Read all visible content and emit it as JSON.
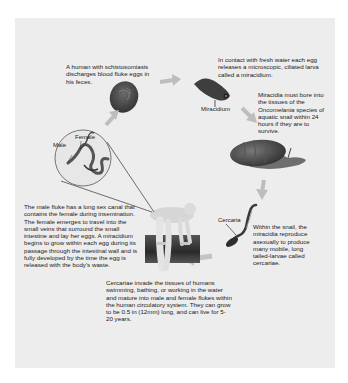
{
  "diagram": {
    "colors": {
      "background": "#ffffff",
      "panel": "#ededed",
      "arrow": "#b8b8b8",
      "egg": "#4a4a4a",
      "text": "#1a1a1a"
    },
    "steps": {
      "human_eggs": "A human with schistosomiasis discharges blood fluke eggs in his feces.",
      "miracidium_release": "In contact with fresh water each egg releases a microscopic, ciliated larva called a miracidium.",
      "snail_entry_pre": "Miracidia must bore into the tissues of the ",
      "snail_entry_species": "Oncomelania",
      "snail_entry_post": " species of aquatic snail within 24 hours if they are to survive.",
      "snail_reproduction": "Within the snail, the miracidia reproduce asexually to produce many mobile, long tailed-larvae called cercariae.",
      "cercariae_invade": "Cercariae invade the tissues of humans swimming, bathing, or working in the water and mature into male and female flukes within the human circulatory system. They can grow to be 0.5 in (12mm) long, and can live for 5-20 years.",
      "fluke_mating": "The male fluke has a long sex canal that contains the female during insemination. The female emerges to travel into the small veins that surround the small intestine and lay her eggs. A miracidium begins to grow within each egg during its passage through the intestinal wall and is fully developed by the time the egg is released with the body's waste."
    },
    "labels": {
      "miracidium": "Miracidium",
      "female": "Female",
      "male": "Male",
      "cercaria": "Cercaria"
    },
    "icons": [
      "egg-icon",
      "miracidium-icon",
      "snail-icon",
      "cercaria-icon",
      "human-wading-icon",
      "fluke-pair-icon",
      "arrow-icon"
    ]
  }
}
